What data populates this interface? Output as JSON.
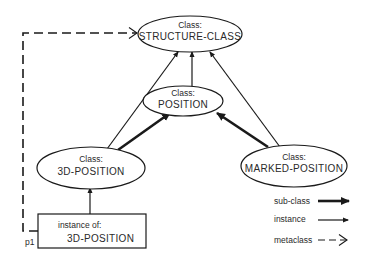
{
  "diagram": {
    "nodes": {
      "structure_class": {
        "kind": "Class:",
        "name": "STRUCTURE-CLASS"
      },
      "position": {
        "kind": "Class:",
        "name": "POSITION"
      },
      "three_d_position": {
        "kind": "Class:",
        "name": "3D-POSITION"
      },
      "marked_position": {
        "kind": "Class:",
        "name": "MARKED-POSITION"
      },
      "instance": {
        "kind": "instance of:",
        "name": "3D-POSITION",
        "label": "p1"
      }
    },
    "edges": [
      {
        "from": "POSITION",
        "to": "STRUCTURE-CLASS",
        "type": "instance"
      },
      {
        "from": "3D-POSITION",
        "to": "STRUCTURE-CLASS",
        "type": "instance"
      },
      {
        "from": "MARKED-POSITION",
        "to": "STRUCTURE-CLASS",
        "type": "instance"
      },
      {
        "from": "3D-POSITION",
        "to": "POSITION",
        "type": "sub-class"
      },
      {
        "from": "MARKED-POSITION",
        "to": "POSITION",
        "type": "sub-class"
      },
      {
        "from": "p1",
        "to": "3D-POSITION",
        "type": "instance"
      },
      {
        "from": "p1",
        "to": "STRUCTURE-CLASS",
        "type": "metaclass"
      }
    ],
    "legend": [
      {
        "label": "sub-class",
        "style": "thick-arrow"
      },
      {
        "label": "instance",
        "style": "thin-arrow"
      },
      {
        "label": "metaclass",
        "style": "dashed-open-arrow"
      }
    ],
    "colors": {
      "stroke": "#1a1a1a",
      "background": "#ffffff"
    }
  }
}
